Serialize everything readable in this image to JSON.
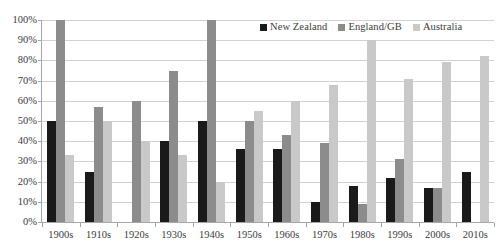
{
  "chart_data": {
    "type": "bar",
    "title": "",
    "subtitle": "",
    "xlabel": "",
    "ylabel": "",
    "ylim": [
      0,
      100
    ],
    "y_tick_labels": [
      "0%",
      "10%",
      "20%",
      "30%",
      "40%",
      "50%",
      "60%",
      "70%",
      "80%",
      "90%",
      "100%"
    ],
    "y_tick_values": [
      0,
      10,
      20,
      30,
      40,
      50,
      60,
      70,
      80,
      90,
      100
    ],
    "grid": "horizontal",
    "legend_position": "top-right",
    "value_suffix": "%",
    "categories": [
      "1900s",
      "1910s",
      "1920s",
      "1930s",
      "1940s",
      "1950s",
      "1960s",
      "1970s",
      "1980s",
      "1990s",
      "2000s",
      "2010s"
    ],
    "series": [
      {
        "name": "New Zealand",
        "color": "#1a1a1a",
        "values": [
          50,
          25,
          0,
          40,
          50,
          36,
          36,
          10,
          18,
          22,
          17,
          25
        ]
      },
      {
        "name": "England/GB",
        "color": "#8c8c8c",
        "values": [
          100,
          57,
          60,
          75,
          100,
          50,
          43,
          39,
          9,
          31,
          17,
          0
        ]
      },
      {
        "name": "Australia",
        "color": "#c9c9c9",
        "values": [
          33,
          50,
          40,
          33,
          20,
          55,
          60,
          68,
          90,
          71,
          79,
          82
        ]
      }
    ]
  },
  "axis": {
    "line_color": "#a6a6a6",
    "grid_color": "#d2d2d2"
  }
}
